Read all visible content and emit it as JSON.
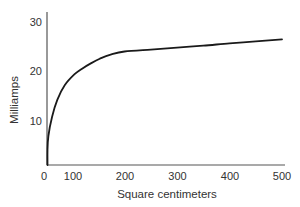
{
  "chart_data": {
    "type": "line",
    "title": "",
    "xlabel": "Square centimeters",
    "ylabel": "Milliamps",
    "xlim": [
      50,
      500
    ],
    "ylim": [
      0,
      30
    ],
    "grid": false,
    "legend": null,
    "x_ticks": [
      0,
      100,
      200,
      300,
      400,
      500
    ],
    "y_ticks": [
      10,
      20,
      30
    ],
    "series": [
      {
        "name": "Current vs area",
        "x": [
          50,
          52,
          55,
          62,
          72,
          86,
          105,
          120,
          135,
          153,
          175,
          200,
          250,
          300,
          350,
          400,
          450,
          500
        ],
        "values": [
          0,
          3,
          6,
          10,
          13.5,
          16.5,
          18.8,
          20,
          21,
          22,
          22.9,
          23.5,
          23.9,
          24.3,
          24.7,
          25.2,
          25.6,
          26
        ]
      }
    ]
  },
  "axes": {
    "x_title": "Square centimeters",
    "y_title": "Milliamps",
    "x_tick_labels": [
      "0",
      "100",
      "200",
      "300",
      "400",
      "500"
    ],
    "y_tick_labels": [
      "10",
      "20",
      "30"
    ]
  },
  "colors": {
    "line": "#1a1a1a",
    "axis": "#555555",
    "text": "#333333",
    "background": "#ffffff"
  }
}
